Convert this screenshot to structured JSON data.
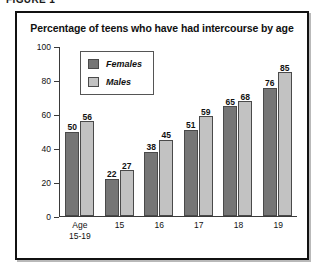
{
  "figure": {
    "caption": "FIGURE 1"
  },
  "chart_data": {
    "type": "bar",
    "title": "Percentage of teens who have had intercourse by age",
    "xlabel": "",
    "ylabel": "",
    "ylim": [
      0,
      100
    ],
    "yticks": [
      0,
      20,
      40,
      60,
      80,
      100
    ],
    "grid": false,
    "legend_position": "upper-left-inside",
    "categories": [
      "Age 15-19",
      "15",
      "16",
      "17",
      "18",
      "19"
    ],
    "category_labels": [
      {
        "line1": "Age",
        "line2": "15-19"
      },
      {
        "line1": "15",
        "line2": ""
      },
      {
        "line1": "16",
        "line2": ""
      },
      {
        "line1": "17",
        "line2": ""
      },
      {
        "line1": "18",
        "line2": ""
      },
      {
        "line1": "19",
        "line2": ""
      }
    ],
    "series": [
      {
        "name": "Females",
        "color": "#767676",
        "values": [
          50,
          22,
          38,
          51,
          65,
          76
        ]
      },
      {
        "name": "Males",
        "color": "#c2c2c2",
        "values": [
          56,
          27,
          45,
          59,
          68,
          85
        ]
      }
    ]
  }
}
